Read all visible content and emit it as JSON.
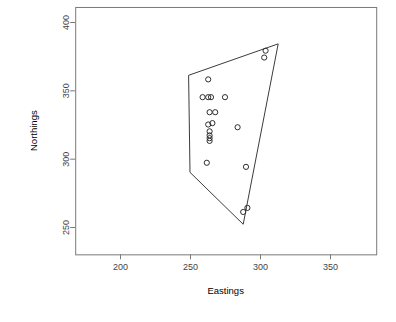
{
  "chart_data": {
    "type": "scatter",
    "title": "",
    "subtitle": "",
    "xlabel": "Eastings",
    "ylabel": "Northings",
    "xlim": [
      168,
      383
    ],
    "ylim": [
      230,
      411
    ],
    "xticks": [
      200,
      250,
      300,
      350
    ],
    "yticks": [
      250,
      300,
      350,
      400
    ],
    "xtick_labels": [
      "200",
      "250",
      "300",
      "350"
    ],
    "ytick_labels": [
      "250",
      "300",
      "350",
      "400"
    ],
    "grid": false,
    "legend": null,
    "legend_position": "none",
    "point_symbol": "open-circle",
    "point_color": "#2e2e2e",
    "hull_color": "#3b3b3b",
    "annotations": [],
    "x": [
      263,
      259,
      263,
      265,
      275,
      264,
      268,
      263,
      266,
      264,
      264,
      264,
      264,
      284,
      262,
      290,
      303,
      304,
      288,
      291
    ],
    "y": [
      358,
      345,
      345,
      345,
      345,
      334,
      334,
      325,
      326,
      320,
      317,
      315,
      313,
      323,
      297,
      294,
      374,
      379,
      261,
      264
    ],
    "points": [
      {
        "x": 263,
        "y": 358
      },
      {
        "x": 259,
        "y": 345
      },
      {
        "x": 263,
        "y": 345
      },
      {
        "x": 265,
        "y": 345
      },
      {
        "x": 275,
        "y": 345
      },
      {
        "x": 264,
        "y": 334
      },
      {
        "x": 268,
        "y": 334
      },
      {
        "x": 263,
        "y": 325
      },
      {
        "x": 266,
        "y": 326
      },
      {
        "x": 264,
        "y": 320
      },
      {
        "x": 264,
        "y": 317
      },
      {
        "x": 264,
        "y": 315
      },
      {
        "x": 264,
        "y": 313
      },
      {
        "x": 284,
        "y": 323
      },
      {
        "x": 262,
        "y": 297
      },
      {
        "x": 290,
        "y": 294
      },
      {
        "x": 303,
        "y": 374
      },
      {
        "x": 304,
        "y": 379
      },
      {
        "x": 288,
        "y": 261
      },
      {
        "x": 291,
        "y": 264
      }
    ],
    "hull_vertices": [
      {
        "x": 249,
        "y": 361
      },
      {
        "x": 313,
        "y": 384
      },
      {
        "x": 288,
        "y": 252
      },
      {
        "x": 250,
        "y": 290
      }
    ],
    "n_points": 20,
    "hull_closed": true
  },
  "figure": {
    "background_color": "#ffffff",
    "panel_border_color": "#7a7a7a",
    "axis_color": "#7a7a7a",
    "text_color": "#000000",
    "tick_label_color": "#444444"
  }
}
